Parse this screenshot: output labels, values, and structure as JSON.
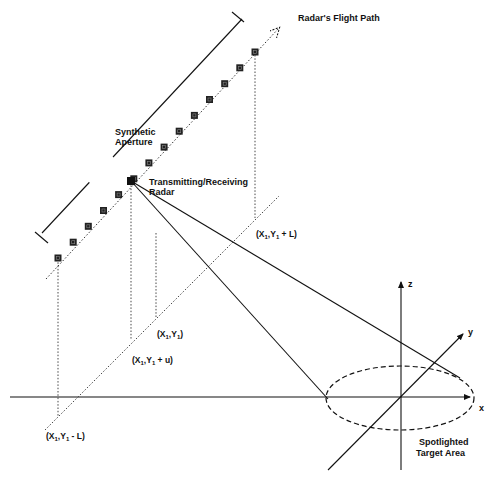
{
  "diagram": {
    "labels": {
      "flight_path": "Radar's Flight Path",
      "synthetic_aperture_line1": "Synthetic",
      "synthetic_aperture_line2": "Aperture",
      "radar_line1": "Transmitting/Receiving",
      "radar_line2": "Radar",
      "point_plus_L": {
        "base": "(X",
        "sub1": "1",
        "mid": ",Y",
        "sub2": "1",
        "tail": " + L)"
      },
      "point_center": {
        "base": "(X",
        "sub1": "1",
        "mid": ",Y",
        "sub2": "1",
        "tail": ")"
      },
      "point_plus_u": {
        "base": "(X",
        "sub1": "1",
        "mid": ",Y",
        "sub2": "1",
        "tail": " + u)"
      },
      "point_minus_L": {
        "base": "(X",
        "sub1": "1",
        "mid": ",Y",
        "sub2": "1",
        "tail": " - L)"
      },
      "target_line1": "Spotlighted",
      "target_line2": "Target Area",
      "axis_x": "x",
      "axis_y": "y",
      "axis_z": "z"
    },
    "aperture_element_count": 14,
    "colors": {
      "ink": "#111111",
      "background": "#ffffff"
    }
  }
}
